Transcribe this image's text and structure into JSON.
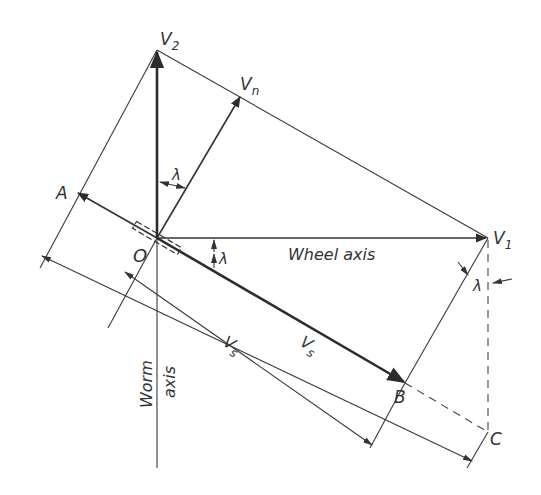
{
  "diagram": {
    "labels": {
      "v2": "V",
      "v2_sub": "2",
      "vn": "V",
      "vn_sub": "n",
      "v1": "V",
      "v1_sub": "1",
      "a": "A",
      "o": "O",
      "b": "B",
      "c": "C",
      "lambda_top": "λ",
      "lambda_mid": "λ",
      "lambda_right": "λ",
      "wheel_axis": "Wheel axis",
      "worm": "Worm",
      "axis": "axis",
      "vs_outer": "V",
      "vs_outer_sub": "s",
      "vs_inner": "V",
      "vs_inner_sub": "s"
    },
    "colors": {
      "line": "#2c2c2c",
      "background": "#ffffff"
    }
  }
}
